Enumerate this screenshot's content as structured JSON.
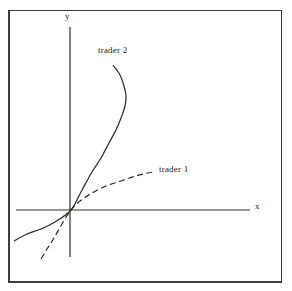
{
  "chart_data": {
    "type": "line",
    "grid": false,
    "legend": "inline labels next to each curve",
    "axes": {
      "x_axis": {
        "label": "x",
        "from_px": [
          16,
          210
        ],
        "to_px": [
          250,
          210
        ]
      },
      "y_axis": {
        "label": "y",
        "from_px": [
          70,
          27
        ],
        "to_px": [
          70,
          257
        ]
      },
      "origin_px": [
        71,
        210
      ]
    },
    "series": [
      {
        "name": "trader 2",
        "line_style": "solid",
        "shape": "convex, steepening from lower-left through origin, bending backward near the top",
        "points_px": [
          [
            14,
            241
          ],
          [
            27,
            234
          ],
          [
            41,
            229
          ],
          [
            55,
            222
          ],
          [
            71,
            210
          ],
          [
            82,
            190
          ],
          [
            92,
            172
          ],
          [
            101,
            158
          ],
          [
            109,
            143
          ],
          [
            116,
            130
          ],
          [
            121,
            118
          ],
          [
            125,
            106
          ],
          [
            126,
            96
          ],
          [
            124,
            86
          ],
          [
            120,
            75
          ],
          [
            113,
            65
          ]
        ]
      },
      {
        "name": "trader 1",
        "line_style": "dashed",
        "shape": "concave, steep from below origin then flattening to the right",
        "points_px": [
          [
            41,
            259
          ],
          [
            47,
            249
          ],
          [
            54,
            238
          ],
          [
            62,
            224
          ],
          [
            71,
            210
          ],
          [
            80,
            201
          ],
          [
            92,
            193
          ],
          [
            106,
            186
          ],
          [
            121,
            181
          ],
          [
            136,
            176
          ],
          [
            148,
            173
          ],
          [
            154,
            172
          ]
        ]
      }
    ]
  },
  "colors": {
    "ink": "#2e2e2c",
    "frame": "#3d3d3b",
    "paper": "#fcfcfa"
  }
}
